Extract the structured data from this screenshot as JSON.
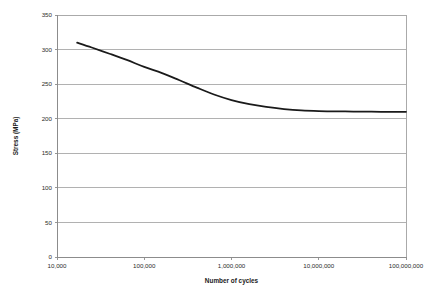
{
  "chart_data": {
    "type": "line",
    "title": "",
    "subtitle": "",
    "xlabel": "Number of cycles",
    "ylabel": "Stress (MPa)",
    "xscale": "log",
    "yscale": "linear",
    "xlim": [
      10000,
      100000000
    ],
    "ylim": [
      0,
      350
    ],
    "grid": true,
    "grid_axis": "y",
    "legend": false,
    "legend_position": "none",
    "x_tick_labels": [
      "10,000",
      "100,000",
      "1,000,000",
      "10,000,000",
      "100,000,000"
    ],
    "x_ticks": [
      10000,
      100000,
      1000000,
      10000000,
      100000000
    ],
    "y_tick_labels": [
      "0",
      "50",
      "100",
      "150",
      "200",
      "250",
      "300",
      "350"
    ],
    "y_ticks": [
      0,
      50,
      100,
      150,
      200,
      250,
      300,
      350
    ],
    "series": [
      {
        "name": "S-N curve",
        "color": "#1a1a1a",
        "x": [
          17000,
          25000,
          40000,
          63000,
          100000,
          160000,
          250000,
          400000,
          630000,
          1000000,
          1600000,
          2500000,
          4000000,
          6300000,
          10000000,
          16000000,
          25000000,
          40000000,
          63000000,
          100000000
        ],
        "y": [
          310,
          303,
          294,
          285,
          275,
          266,
          256,
          245,
          235,
          227,
          221,
          217,
          214,
          212,
          211,
          210.6,
          210.3,
          210.1,
          210,
          210
        ]
      }
    ],
    "annotations": [],
    "colors": {
      "curve": "#1a1a1a",
      "gridline": "#a9a9a9",
      "axis": "#8c8c8c",
      "frame": "#aaaaaa",
      "text": "#2b2b2b",
      "background": "#ffffff"
    },
    "geometry": {
      "plot_left": 57,
      "plot_right": 406,
      "plot_top": 15,
      "plot_bottom": 257
    }
  }
}
